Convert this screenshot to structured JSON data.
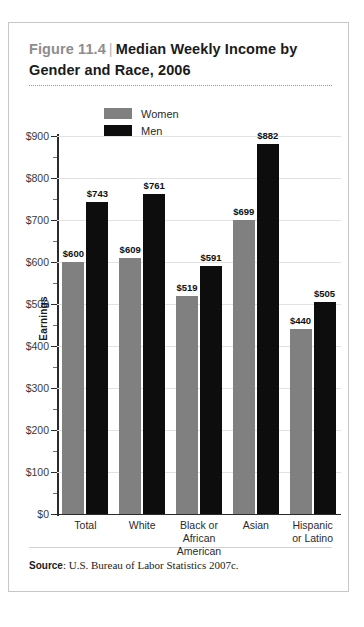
{
  "figure": {
    "number": "Figure 11.4",
    "separator": "|",
    "title": "Median Weekly Income by Gender and Race, 2006",
    "source_label": "Source",
    "source_colon": ":",
    "source_text": "U.S. Bureau of Labor Statistics 2007c."
  },
  "colors": {
    "women": "#808080",
    "men": "#0d0d0d",
    "grid": "#e2e2e2",
    "axis": "#2b2b2b",
    "figure_number": "#8d8d8d",
    "border": "#c7c7c7"
  },
  "chart_data": {
    "type": "bar",
    "title": "Median Weekly Income by Gender and Race, 2006",
    "xlabel": "",
    "ylabel": "Earnings",
    "ylim": [
      0,
      900
    ],
    "ytick_step": 100,
    "yminor_step": 50,
    "grid": true,
    "legend_position": "top-left-inside",
    "value_prefix": "$",
    "categories": [
      "Total",
      "White",
      "Black or African American",
      "Asian",
      "Hispanic or Latino"
    ],
    "category_lines": [
      [
        "Total"
      ],
      [
        "White"
      ],
      [
        "Black or",
        "African",
        "American"
      ],
      [
        "Asian"
      ],
      [
        "Hispanic",
        "or Latino"
      ]
    ],
    "ytick_labels": [
      "$900",
      "$800",
      "$700",
      "$600",
      "$500",
      "$400",
      "$300",
      "$200",
      "$100",
      "$0"
    ],
    "ytick_values": [
      900,
      800,
      700,
      600,
      500,
      400,
      300,
      200,
      100,
      0
    ],
    "series": [
      {
        "name": "Women",
        "color": "#808080",
        "values": [
          600,
          609,
          519,
          699,
          440
        ],
        "labels": [
          "$600",
          "$609",
          "$519",
          "$699",
          "$440"
        ]
      },
      {
        "name": "Men",
        "color": "#0d0d0d",
        "values": [
          743,
          761,
          591,
          882,
          505
        ],
        "labels": [
          "$743",
          "$761",
          "$591",
          "$882",
          "$505"
        ]
      }
    ]
  }
}
